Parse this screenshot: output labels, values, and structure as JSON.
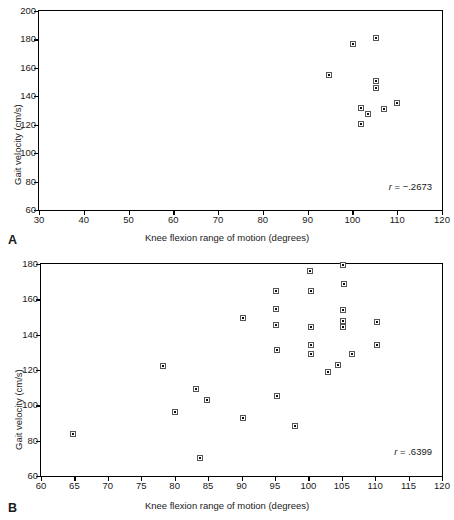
{
  "figure": {
    "panels": [
      {
        "letter": "A",
        "r_prefix": "r",
        "r_eq": "=",
        "r_text": "−.2673",
        "chart": {
          "type": "scatter",
          "title": "",
          "xlabel": "Knee flexion range of motion (degrees)",
          "ylabel": "Gait velocity (cm/s)",
          "xlim": [
            30,
            120
          ],
          "ylim": [
            60,
            200
          ],
          "xticks": [
            30,
            40,
            50,
            60,
            70,
            80,
            90,
            100,
            110,
            120
          ],
          "yticks": [
            60,
            80,
            100,
            120,
            140,
            160,
            180,
            200
          ],
          "grid": false,
          "legend": "none",
          "annotation": "r = −.2673",
          "r": -0.2673,
          "points": [
            {
              "x": 94.8,
              "y": 155
            },
            {
              "x": 100.2,
              "y": 177
            },
            {
              "x": 105.3,
              "y": 181
            },
            {
              "x": 105.3,
              "y": 151
            },
            {
              "x": 105.2,
              "y": 145.5
            },
            {
              "x": 101.8,
              "y": 132
            },
            {
              "x": 103.5,
              "y": 127.5
            },
            {
              "x": 101.9,
              "y": 120.5
            },
            {
              "x": 107.1,
              "y": 131
            },
            {
              "x": 110.0,
              "y": 135
            }
          ]
        }
      },
      {
        "letter": "B",
        "r_prefix": "r",
        "r_eq": "=",
        "r_text": ".6399",
        "chart": {
          "type": "scatter",
          "title": "",
          "xlabel": "Knee flexion range of motion (degrees)",
          "ylabel": "Gait velocity (cm/s)",
          "xlim": [
            60,
            120
          ],
          "ylim": [
            60,
            180
          ],
          "xticks": [
            60,
            65,
            70,
            75,
            80,
            85,
            90,
            95,
            100,
            105,
            110,
            115,
            120
          ],
          "yticks": [
            60,
            80,
            100,
            120,
            140,
            160,
            180
          ],
          "grid": false,
          "legend": "none",
          "annotation": "r = .6399",
          "r": 0.6399,
          "points": [
            {
              "x": 64.8,
              "y": 83.5
            },
            {
              "x": 78.2,
              "y": 122.5
            },
            {
              "x": 80.0,
              "y": 96.5
            },
            {
              "x": 83.2,
              "y": 109
            },
            {
              "x": 83.8,
              "y": 70
            },
            {
              "x": 84.8,
              "y": 103
            },
            {
              "x": 90.2,
              "y": 149.5
            },
            {
              "x": 90.2,
              "y": 93
            },
            {
              "x": 95.1,
              "y": 164.5
            },
            {
              "x": 95.2,
              "y": 154.5
            },
            {
              "x": 95.2,
              "y": 145.5
            },
            {
              "x": 95.3,
              "y": 131.5
            },
            {
              "x": 95.3,
              "y": 105.5
            },
            {
              "x": 98.0,
              "y": 88.5
            },
            {
              "x": 100.3,
              "y": 176
            },
            {
              "x": 100.4,
              "y": 164.5
            },
            {
              "x": 100.4,
              "y": 144.5
            },
            {
              "x": 100.4,
              "y": 134
            },
            {
              "x": 100.4,
              "y": 129
            },
            {
              "x": 102.9,
              "y": 119
            },
            {
              "x": 104.4,
              "y": 123
            },
            {
              "x": 105.2,
              "y": 179.5
            },
            {
              "x": 105.3,
              "y": 168.5
            },
            {
              "x": 105.2,
              "y": 154
            },
            {
              "x": 105.2,
              "y": 147.5
            },
            {
              "x": 105.2,
              "y": 144.5
            },
            {
              "x": 106.6,
              "y": 129
            },
            {
              "x": 110.2,
              "y": 147
            },
            {
              "x": 110.2,
              "y": 134
            }
          ]
        }
      }
    ]
  }
}
